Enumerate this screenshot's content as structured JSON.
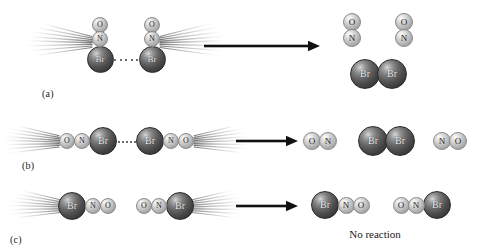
{
  "figure": {
    "background_color": "#ffffff",
    "width": 477,
    "height": 252
  },
  "atom_styles": {
    "br": {
      "label": "Br",
      "kind": "large-dark",
      "color": "#4a4a4a",
      "diameter": 27,
      "font_size": 9
    },
    "n": {
      "label": "N",
      "kind": "small-light",
      "color": "#c8c8c8",
      "diameter": 16,
      "font_size": 8
    },
    "o": {
      "label": "O",
      "kind": "small-light",
      "color": "#c8c8c8",
      "diameter": 16,
      "font_size": 8
    }
  },
  "arrow": {
    "color": "#111111",
    "name": "reaction-arrow"
  },
  "rows": [
    {
      "id": "a",
      "label": "(a)",
      "label_x": 42,
      "label_y": 88,
      "arrow": {
        "x": 204,
        "y": 46,
        "length": 116
      },
      "reactants": {
        "description": "Two NOBr molecules approaching Br-end to Br-end, oriented vertically",
        "molecules": [
          {
            "name": "nobr-molecule-left",
            "orientation": "vertical",
            "streak_side": "left",
            "atoms": [
              {
                "type": "o",
                "label": "O",
                "cx": 100,
                "cy": 25,
                "d": 16
              },
              {
                "type": "n",
                "label": "N",
                "cx": 100,
                "cy": 39,
                "d": 16
              },
              {
                "type": "br",
                "label": "Br",
                "cx": 100,
                "cy": 59,
                "d": 27
              }
            ]
          },
          {
            "name": "nobr-molecule-right",
            "orientation": "vertical",
            "streak_side": "right",
            "atoms": [
              {
                "type": "o",
                "label": "O",
                "cx": 152,
                "cy": 25,
                "d": 16
              },
              {
                "type": "n",
                "label": "N",
                "cx": 152,
                "cy": 39,
                "d": 16
              },
              {
                "type": "br",
                "label": "Br",
                "cx": 152,
                "cy": 59,
                "d": 27
              }
            ]
          }
        ],
        "collision": {
          "x1": 114,
          "x2": 138,
          "y": 59
        }
      },
      "products": {
        "description": "Two NO molecules and one Br2 molecule",
        "molecules": [
          {
            "name": "no-molecule-left",
            "atoms": [
              {
                "type": "o",
                "label": "O",
                "cx": 352,
                "cy": 22,
                "d": 18
              },
              {
                "type": "n",
                "label": "N",
                "cx": 352,
                "cy": 38,
                "d": 18
              }
            ]
          },
          {
            "name": "no-molecule-right",
            "atoms": [
              {
                "type": "o",
                "label": "O",
                "cx": 404,
                "cy": 22,
                "d": 18
              },
              {
                "type": "n",
                "label": "N",
                "cx": 404,
                "cy": 38,
                "d": 18
              }
            ]
          },
          {
            "name": "br2-molecule",
            "atoms": [
              {
                "type": "br",
                "label": "Br",
                "cx": 365,
                "cy": 74,
                "d": 30
              },
              {
                "type": "br",
                "label": "Br",
                "cx": 392,
                "cy": 74,
                "d": 30
              }
            ]
          }
        ]
      }
    },
    {
      "id": "b",
      "label": "(b)",
      "label_x": 22,
      "label_y": 160,
      "arrow": {
        "x": 236,
        "y": 141,
        "length": 62
      },
      "reactants": {
        "description": "Two NOBr molecules approaching Br-end to Br-end, oriented horizontally",
        "molecules": [
          {
            "name": "nobr-molecule-left",
            "orientation": "horizontal",
            "streak_side": "left",
            "atoms": [
              {
                "type": "o",
                "label": "O",
                "cx": 67,
                "cy": 141,
                "d": 16
              },
              {
                "type": "n",
                "label": "N",
                "cx": 82,
                "cy": 141,
                "d": 16
              },
              {
                "type": "br",
                "label": "Br",
                "cx": 103,
                "cy": 141,
                "d": 28
              }
            ]
          },
          {
            "name": "nobr-molecule-right",
            "orientation": "horizontal",
            "streak_side": "right",
            "atoms": [
              {
                "type": "br",
                "label": "Br",
                "cx": 150,
                "cy": 141,
                "d": 28
              },
              {
                "type": "n",
                "label": "N",
                "cx": 171,
                "cy": 141,
                "d": 16
              },
              {
                "type": "o",
                "label": "O",
                "cx": 186,
                "cy": 141,
                "d": 16
              }
            ]
          }
        ],
        "collision": {
          "x1": 118,
          "x2": 136,
          "y": 141
        }
      },
      "products": {
        "description": "Two NO molecules and one Br2 molecule",
        "molecules": [
          {
            "name": "no-molecule-left",
            "atoms": [
              {
                "type": "o",
                "label": "O",
                "cx": 312,
                "cy": 141,
                "d": 18
              },
              {
                "type": "n",
                "label": "N",
                "cx": 328,
                "cy": 141,
                "d": 18
              }
            ]
          },
          {
            "name": "br2-molecule",
            "atoms": [
              {
                "type": "br",
                "label": "Br",
                "cx": 373,
                "cy": 141,
                "d": 30
              },
              {
                "type": "br",
                "label": "Br",
                "cx": 400,
                "cy": 141,
                "d": 30
              }
            ]
          },
          {
            "name": "no-molecule-right",
            "atoms": [
              {
                "type": "n",
                "label": "N",
                "cx": 442,
                "cy": 141,
                "d": 18
              },
              {
                "type": "o",
                "label": "O",
                "cx": 458,
                "cy": 141,
                "d": 18
              }
            ]
          }
        ]
      }
    },
    {
      "id": "c",
      "label": "(c)",
      "label_x": 10,
      "label_y": 234,
      "arrow": {
        "x": 236,
        "y": 206,
        "length": 62
      },
      "reactants": {
        "description": "Two NOBr molecules with unfavorable orientation, Br ends facing outward",
        "molecules": [
          {
            "name": "nobr-molecule-left",
            "orientation": "horizontal",
            "streak_side": "left",
            "atoms": [
              {
                "type": "br",
                "label": "Br",
                "cx": 72,
                "cy": 206,
                "d": 28
              },
              {
                "type": "n",
                "label": "N",
                "cx": 93,
                "cy": 206,
                "d": 16
              },
              {
                "type": "o",
                "label": "O",
                "cx": 108,
                "cy": 206,
                "d": 16
              }
            ]
          },
          {
            "name": "nobr-molecule-right",
            "orientation": "horizontal",
            "streak_side": "right",
            "atoms": [
              {
                "type": "o",
                "label": "O",
                "cx": 144,
                "cy": 206,
                "d": 16
              },
              {
                "type": "n",
                "label": "N",
                "cx": 159,
                "cy": 206,
                "d": 16
              },
              {
                "type": "br",
                "label": "Br",
                "cx": 180,
                "cy": 206,
                "d": 28
              }
            ]
          }
        ],
        "collision": null
      },
      "products": {
        "description": "Unchanged NOBr molecules — no reaction occurs",
        "caption": "No reaction",
        "caption_x": 375,
        "caption_y": 228,
        "molecules": [
          {
            "name": "nobr-molecule-left",
            "atoms": [
              {
                "type": "br",
                "label": "Br",
                "cx": 325,
                "cy": 205,
                "d": 28
              },
              {
                "type": "n",
                "label": "N",
                "cx": 346,
                "cy": 205,
                "d": 17
              },
              {
                "type": "o",
                "label": "O",
                "cx": 361,
                "cy": 205,
                "d": 17
              }
            ]
          },
          {
            "name": "nobr-molecule-right",
            "atoms": [
              {
                "type": "o",
                "label": "O",
                "cx": 401,
                "cy": 205,
                "d": 17
              },
              {
                "type": "n",
                "label": "N",
                "cx": 416,
                "cy": 205,
                "d": 17
              },
              {
                "type": "br",
                "label": "Br",
                "cx": 437,
                "cy": 205,
                "d": 28
              }
            ]
          }
        ]
      }
    }
  ]
}
